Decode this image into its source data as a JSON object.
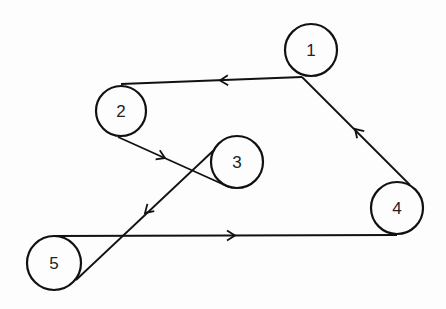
{
  "diagram": {
    "type": "belt-pulley-path",
    "pulleys": [
      {
        "label": "1",
        "cx": 311,
        "cy": 50,
        "r": 26
      },
      {
        "label": "2",
        "cx": 121,
        "cy": 111,
        "r": 25
      },
      {
        "label": "3",
        "cx": 237,
        "cy": 162,
        "r": 26
      },
      {
        "label": "4",
        "cx": 397,
        "cy": 208,
        "r": 26
      },
      {
        "label": "5",
        "cx": 54,
        "cy": 263,
        "r": 27
      }
    ],
    "segments": [
      {
        "from": "1",
        "to": "2",
        "x1": 302,
        "y1": 77,
        "x2": 121,
        "y2": 84,
        "arrow": [
          220,
          80.5
        ]
      },
      {
        "from": "2",
        "to": "3",
        "x1": 118,
        "y1": 137,
        "x2": 229,
        "y2": 187,
        "arrow": [
          165,
          158
        ]
      },
      {
        "from": "3",
        "to": "5",
        "x1": 214,
        "y1": 150,
        "x2": 76,
        "y2": 280,
        "arrow": [
          145,
          213
        ]
      },
      {
        "from": "5",
        "to": "4",
        "x1": 54,
        "y1": 236,
        "x2": 397,
        "y2": 235,
        "arrow": [
          235,
          235.5
        ]
      },
      {
        "from": "4",
        "to": "1",
        "x1": 410,
        "y1": 185,
        "x2": 302,
        "y2": 77,
        "arrow": [
          355,
          129
        ]
      }
    ],
    "line_color": "#111111"
  }
}
